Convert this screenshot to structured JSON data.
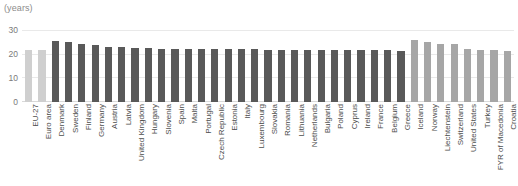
{
  "chart_data": {
    "type": "bar",
    "title": "",
    "subtitle": "",
    "xlabel": "",
    "ylabel": "(years)",
    "unit_label": "(years)",
    "ylim": [
      0,
      32
    ],
    "yticks": [
      0,
      10,
      20,
      30
    ],
    "ytick_labels": [
      "0",
      "10",
      "20",
      "30"
    ],
    "grid": true,
    "legend": "none",
    "orientation": "vertical",
    "categories": [
      "EU-27",
      "Euro area",
      "Denmark",
      "Sweden",
      "Finland",
      "Germany",
      "Austria",
      "Latvia",
      "United Kingdom",
      "Hungary",
      "Slovenia",
      "Spain",
      "Malta",
      "Portugal",
      "Czech Republic",
      "Estonia",
      "Italy",
      "Luxembourg",
      "Slovakia",
      "Romania",
      "Lithuania",
      "Netherlands",
      "Bulgaria",
      "Poland",
      "Cyprus",
      "Ireland",
      "France",
      "Belgium",
      "Greece",
      "Iceland",
      "Norway",
      "Liechtenstein",
      "Switzerland",
      "United States",
      "Turkey",
      "FYR of Macedonia",
      "Croatia"
    ],
    "values": [
      22.0,
      22.0,
      25.6,
      25.4,
      24.5,
      23.8,
      23.3,
      23.0,
      22.8,
      22.7,
      22.5,
      22.4,
      22.4,
      22.3,
      22.3,
      22.2,
      22.2,
      22.2,
      22.1,
      22.1,
      22.1,
      22.0,
      22.0,
      22.0,
      22.0,
      22.0,
      21.9,
      21.9,
      21.4,
      26.2,
      25.2,
      24.6,
      24.5,
      22.2,
      21.8,
      21.7,
      21.3
    ],
    "series_groups": [
      {
        "name": "aggregate",
        "color": "#cfcfcf",
        "indices": [
          0,
          1
        ]
      },
      {
        "name": "eu-member-states",
        "color": "#595959",
        "indices": [
          2,
          3,
          4,
          5,
          6,
          7,
          8,
          9,
          10,
          11,
          12,
          13,
          14,
          15,
          16,
          17,
          18,
          19,
          20,
          21,
          22,
          23,
          24,
          25,
          26,
          27,
          28
        ]
      },
      {
        "name": "non-eu-countries",
        "color": "#a6a6a6",
        "indices": [
          29,
          30,
          31,
          32,
          33,
          34,
          35,
          36
        ]
      }
    ]
  },
  "colors": {
    "aggregate_bar": "#cfcfcf",
    "member_bar": "#595959",
    "non_member_bar": "#a6a6a6",
    "gridline": "#e9e9e9",
    "baseline": "#d9d9d9",
    "axis_text": "#7a7a7a",
    "label_text": "#4d4d4d",
    "background": "#ffffff"
  }
}
